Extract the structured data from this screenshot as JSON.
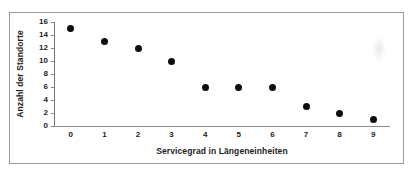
{
  "chart_data": {
    "type": "scatter",
    "title": "",
    "xlabel": "Servicegrad in Längeneinheiten",
    "ylabel": "Anzahl der Standorte",
    "x": [
      0,
      1,
      2,
      3,
      4,
      5,
      6,
      7,
      8,
      9
    ],
    "values": [
      15,
      13,
      12,
      10,
      6,
      6,
      6,
      3,
      2,
      1
    ],
    "series": [
      {
        "name": "Anzahl der Standorte",
        "points": [
          {
            "x": 0,
            "y": 15
          },
          {
            "x": 1,
            "y": 13
          },
          {
            "x": 2,
            "y": 12
          },
          {
            "x": 3,
            "y": 10
          },
          {
            "x": 4,
            "y": 6
          },
          {
            "x": 5,
            "y": 6
          },
          {
            "x": 6,
            "y": 6
          },
          {
            "x": 7,
            "y": 3
          },
          {
            "x": 8,
            "y": 2
          },
          {
            "x": 9,
            "y": 1
          }
        ],
        "marker_color": "#0d0d0d",
        "marker_shape": "circle"
      }
    ],
    "xlim": [
      -0.5,
      9.5
    ],
    "ylim": [
      0,
      16
    ],
    "xticks": [
      0,
      1,
      2,
      3,
      4,
      5,
      6,
      7,
      8,
      9
    ],
    "yticks": [
      0,
      2,
      4,
      6,
      8,
      10,
      12,
      14,
      16
    ],
    "xticklabels": [
      "0",
      "1",
      "2",
      "3",
      "4",
      "5",
      "6",
      "7",
      "8",
      "9"
    ],
    "yticklabels": [
      "0",
      "2",
      "4",
      "6",
      "8",
      "10",
      "12",
      "14",
      "16"
    ],
    "grid": false,
    "legend": false,
    "legend_position": "none",
    "frame_color": "#9a9a9a",
    "axis_color": "#888888"
  }
}
